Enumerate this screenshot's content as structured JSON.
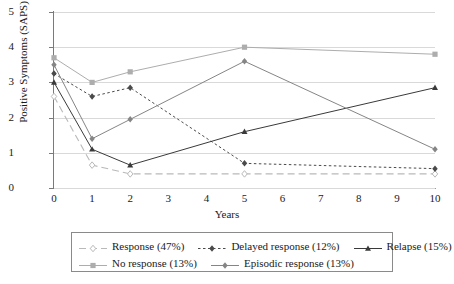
{
  "chart_data": {
    "type": "line",
    "title": "",
    "xlabel": "Years",
    "ylabel": "Positive Symptoms (SAPS)",
    "x": [
      0,
      1,
      2,
      5,
      10
    ],
    "xlim": [
      0,
      10
    ],
    "ylim": [
      0,
      5
    ],
    "xticks": [
      "0",
      "1",
      "2",
      "3",
      "4",
      "5",
      "6",
      "7",
      "8",
      "9",
      "10"
    ],
    "yticks": [
      "0",
      "1",
      "2",
      "3",
      "4",
      "5"
    ],
    "grid": "horizontal",
    "legend_position": "bottom",
    "series": [
      {
        "name": "Response (47%)",
        "values": [
          2.6,
          0.65,
          0.4,
          0.4,
          0.4
        ],
        "color": "#b9b9b9",
        "dash": "7,4",
        "marker": "diamond-open",
        "width": 1.1
      },
      {
        "name": "Delayed response (12%)",
        "values": [
          3.25,
          2.6,
          2.85,
          0.7,
          0.55
        ],
        "color": "#4a4a4a",
        "dash": "2.5,2.5",
        "marker": "diamond",
        "width": 1.0
      },
      {
        "name": "Relapse (15%)",
        "values": [
          3.0,
          1.1,
          0.65,
          1.6,
          2.85
        ],
        "color": "#3a3a3a",
        "dash": "",
        "marker": "triangle",
        "width": 1.0
      },
      {
        "name": "No response (13%)",
        "values": [
          3.7,
          3.0,
          3.3,
          4.0,
          3.8
        ],
        "color": "#adadad",
        "dash": "",
        "marker": "square",
        "width": 1.0
      },
      {
        "name": "Episodic response (13%)",
        "values": [
          3.5,
          1.4,
          1.95,
          3.6,
          1.1
        ],
        "color": "#858585",
        "dash": "",
        "marker": "diamond",
        "width": 1.0
      }
    ]
  }
}
